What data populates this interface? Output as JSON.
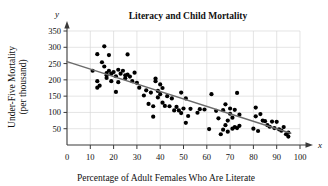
{
  "chart_data": {
    "type": "scatter",
    "title": "Literacy and Child Mortality",
    "xlabel": "Percentage of Adult Females Who Are Literate",
    "ylabel": "Under-Five Mortality (per thousand)",
    "ylabel_line1": "Under-Five Mortality",
    "ylabel_line2": "(per thousand)",
    "x_variable": "x",
    "y_variable": "y",
    "xlim": [
      0,
      100
    ],
    "ylim": [
      0,
      350
    ],
    "grid": true,
    "legend": "none",
    "marker_color": "#000000",
    "trendline_color": "#6b6b6b",
    "xticks": [
      0,
      10,
      20,
      30,
      40,
      50,
      60,
      70,
      80,
      90,
      100
    ],
    "yticks": [
      50,
      100,
      150,
      200,
      250,
      300,
      350
    ],
    "trendline": {
      "x": [
        0,
        96
      ],
      "y": [
        256,
        36
      ]
    },
    "points": [
      [
        11,
        228
      ],
      [
        13,
        279
      ],
      [
        13,
        196
      ],
      [
        13,
        176
      ],
      [
        14,
        182
      ],
      [
        15,
        254
      ],
      [
        16,
        241
      ],
      [
        16,
        303
      ],
      [
        17,
        221
      ],
      [
        17,
        214
      ],
      [
        17,
        206
      ],
      [
        18,
        276
      ],
      [
        18,
        228
      ],
      [
        19,
        219
      ],
      [
        19,
        196
      ],
      [
        20,
        224
      ],
      [
        21,
        211
      ],
      [
        21,
        163
      ],
      [
        22,
        193
      ],
      [
        22,
        231
      ],
      [
        23,
        219
      ],
      [
        24,
        228
      ],
      [
        25,
        205
      ],
      [
        25,
        214
      ],
      [
        26,
        278
      ],
      [
        26,
        216
      ],
      [
        27,
        210
      ],
      [
        28,
        196
      ],
      [
        29,
        222
      ],
      [
        30,
        191
      ],
      [
        31,
        176
      ],
      [
        33,
        152
      ],
      [
        34,
        168
      ],
      [
        35,
        126
      ],
      [
        36,
        161
      ],
      [
        37,
        119
      ],
      [
        37,
        87
      ],
      [
        38,
        204
      ],
      [
        38,
        196
      ],
      [
        39,
        166
      ],
      [
        39,
        146
      ],
      [
        40,
        186
      ],
      [
        40,
        156
      ],
      [
        41,
        175
      ],
      [
        41,
        130
      ],
      [
        42,
        120
      ],
      [
        43,
        150
      ],
      [
        44,
        119
      ],
      [
        45,
        143
      ],
      [
        46,
        106
      ],
      [
        47,
        117
      ],
      [
        48,
        106
      ],
      [
        49,
        161
      ],
      [
        49,
        98
      ],
      [
        50,
        112
      ],
      [
        51,
        143
      ],
      [
        51,
        68
      ],
      [
        52,
        89
      ],
      [
        53,
        111
      ],
      [
        56,
        99
      ],
      [
        57,
        110
      ],
      [
        59,
        109
      ],
      [
        61,
        49
      ],
      [
        62,
        156
      ],
      [
        64,
        105
      ],
      [
        65,
        82
      ],
      [
        66,
        33
      ],
      [
        67,
        47
      ],
      [
        67,
        107
      ],
      [
        68,
        125
      ],
      [
        68,
        61
      ],
      [
        69,
        75
      ],
      [
        69,
        41
      ],
      [
        70,
        96
      ],
      [
        70,
        112
      ],
      [
        71,
        84
      ],
      [
        71,
        50
      ],
      [
        72,
        108
      ],
      [
        72,
        55
      ],
      [
        73,
        160
      ],
      [
        73,
        52
      ],
      [
        74,
        93
      ],
      [
        74,
        59
      ],
      [
        80,
        50
      ],
      [
        81,
        115
      ],
      [
        81,
        88
      ],
      [
        82,
        43
      ],
      [
        83,
        95
      ],
      [
        84,
        75
      ],
      [
        85,
        73
      ],
      [
        86,
        61
      ],
      [
        87,
        56
      ],
      [
        88,
        72
      ],
      [
        89,
        52
      ],
      [
        90,
        71
      ],
      [
        91,
        48
      ],
      [
        92,
        44
      ],
      [
        93,
        55
      ],
      [
        94,
        33
      ],
      [
        95,
        26
      ],
      [
        95,
        38
      ]
    ]
  }
}
